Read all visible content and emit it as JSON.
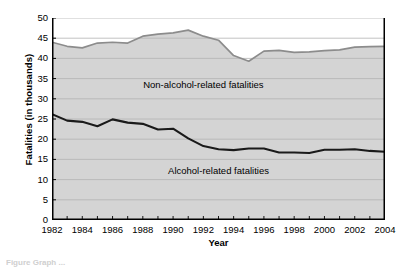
{
  "chart_data": {
    "type": "area",
    "title": "",
    "xlabel": "Year",
    "ylabel": "Fatalities (in thousands)",
    "xlim": [
      1982,
      2004
    ],
    "ylim": [
      0,
      50
    ],
    "yticks": [
      0,
      5,
      10,
      15,
      20,
      25,
      30,
      35,
      40,
      45,
      50
    ],
    "xticks": [
      1982,
      1984,
      1986,
      1988,
      1990,
      1992,
      1994,
      1996,
      1998,
      2000,
      2002,
      2004
    ],
    "xtick_minor_every": 1,
    "grid": "horizontal",
    "legend": "inline-annotations",
    "x": [
      1982,
      1983,
      1984,
      1985,
      1986,
      1987,
      1988,
      1989,
      1990,
      1991,
      1992,
      1993,
      1994,
      1995,
      1996,
      1997,
      1998,
      1999,
      2000,
      2001,
      2002,
      2003,
      2004
    ],
    "series": [
      {
        "name": "Total fatalities",
        "role": "upper-boundary",
        "values": [
          44.0,
          43.0,
          42.6,
          43.8,
          44.0,
          43.8,
          45.5,
          46.0,
          46.3,
          47.0,
          45.5,
          44.5,
          40.7,
          39.3,
          41.8,
          42.0,
          41.5,
          41.6,
          41.9,
          42.1,
          42.8,
          42.9,
          43.0
        ]
      },
      {
        "name": "Alcohol-related fatalities",
        "role": "lower-boundary",
        "values": [
          26.2,
          24.6,
          24.3,
          23.2,
          24.9,
          24.1,
          23.8,
          22.4,
          22.6,
          20.2,
          18.3,
          17.5,
          17.3,
          17.7,
          17.7,
          16.7,
          16.7,
          16.6,
          17.4,
          17.4,
          17.5,
          17.1,
          16.9
        ]
      }
    ],
    "band_labels": {
      "top": "Non-alcohol-related fatalities",
      "bottom": "Alcohol-related fatalities"
    },
    "colors": {
      "band_fill": "#d4d4d4",
      "upper_line": "#8c8c8c",
      "lower_line": "#1a1a1a",
      "grid": "#b3b3b3",
      "axis": "#000000",
      "background": "#ffffff"
    }
  },
  "caption_remnant": "Figure  Graph ..."
}
